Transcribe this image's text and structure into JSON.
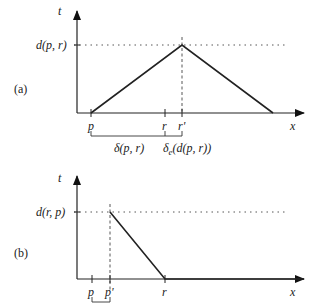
{
  "figure": {
    "panel_a": {
      "tag": "(a)",
      "y_axis_label": "t",
      "x_axis_label": "x",
      "level_label": "d(p, r)",
      "ticks": [
        "p",
        "r",
        "r'"
      ],
      "bracket_label_1": "δ(p, r)",
      "bracket_label_2_main": "δ",
      "bracket_label_2_sub": "e",
      "bracket_label_2_arg": "(d(p, r))"
    },
    "panel_b": {
      "tag": "(b)",
      "y_axis_label": "t",
      "x_axis_label": "x",
      "level_label": "d(r, p)",
      "ticks": [
        "p",
        "p'",
        "r"
      ]
    }
  },
  "colors": {
    "ink": "#222222",
    "background": "#ffffff"
  }
}
